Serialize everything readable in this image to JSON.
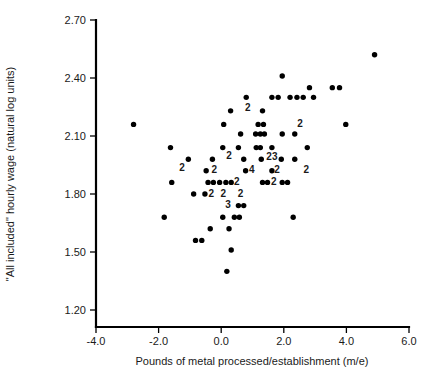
{
  "chart_data": {
    "type": "scatter",
    "title": "",
    "xlabel": "Pounds of metal processed/establishment (m/e)",
    "ylabel": "\"All included\" hourly wage (natural log units)",
    "xlim": [
      -4.0,
      6.0
    ],
    "ylim": [
      1.2,
      2.7
    ],
    "xticks": [
      "-4.0",
      "-2.0",
      "0.0",
      "2.0",
      "4.0",
      "6.0"
    ],
    "xtick_values": [
      -4.0,
      -2.0,
      0.0,
      2.0,
      4.0,
      6.0
    ],
    "yticks": [
      "2.70",
      "2.40",
      "2.10",
      "1.80",
      "1.50",
      "1.20"
    ],
    "ytick_values": [
      2.7,
      2.4,
      2.1,
      1.8,
      1.5,
      1.2
    ],
    "grid": false,
    "legend": false,
    "marker": "filled-circle",
    "marker_color": "#000000",
    "points": [
      [
        4.9,
        2.52
      ],
      [
        1.95,
        2.41
      ],
      [
        2.82,
        2.35
      ],
      [
        3.55,
        2.35
      ],
      [
        3.78,
        2.35
      ],
      [
        0.8,
        2.3
      ],
      [
        1.62,
        2.3
      ],
      [
        1.82,
        2.3
      ],
      [
        2.2,
        2.3
      ],
      [
        2.42,
        2.3
      ],
      [
        2.62,
        2.3
      ],
      [
        2.95,
        2.3
      ],
      [
        0.3,
        2.23
      ],
      [
        1.32,
        2.23
      ],
      [
        0.08,
        2.16
      ],
      [
        -2.8,
        2.16
      ],
      [
        1.18,
        2.16
      ],
      [
        1.35,
        2.16
      ],
      [
        3.98,
        2.16
      ],
      [
        0.62,
        2.11
      ],
      [
        1.1,
        2.11
      ],
      [
        1.25,
        2.11
      ],
      [
        1.38,
        2.11
      ],
      [
        1.95,
        2.11
      ],
      [
        2.35,
        2.11
      ],
      [
        -1.62,
        2.04
      ],
      [
        0.05,
        2.04
      ],
      [
        0.55,
        2.04
      ],
      [
        1.12,
        2.04
      ],
      [
        1.25,
        2.04
      ],
      [
        1.62,
        2.04
      ],
      [
        2.75,
        2.04
      ],
      [
        -1.05,
        1.98
      ],
      [
        -0.28,
        1.98
      ],
      [
        0.72,
        1.98
      ],
      [
        1.28,
        1.98
      ],
      [
        1.92,
        1.98
      ],
      [
        2.35,
        1.98
      ],
      [
        -0.48,
        1.92
      ],
      [
        0.78,
        1.92
      ],
      [
        1.62,
        1.92
      ],
      [
        -1.58,
        1.86
      ],
      [
        -0.42,
        1.86
      ],
      [
        -0.25,
        1.86
      ],
      [
        -0.05,
        1.86
      ],
      [
        0.15,
        1.86
      ],
      [
        0.32,
        1.86
      ],
      [
        1.32,
        1.86
      ],
      [
        1.48,
        1.86
      ],
      [
        1.95,
        1.86
      ],
      [
        2.12,
        1.86
      ],
      [
        -0.88,
        1.8
      ],
      [
        -0.52,
        1.8
      ],
      [
        0.55,
        1.74
      ],
      [
        0.72,
        1.74
      ],
      [
        -1.82,
        1.68
      ],
      [
        0.05,
        1.68
      ],
      [
        0.42,
        1.68
      ],
      [
        0.58,
        1.68
      ],
      [
        2.3,
        1.68
      ],
      [
        -0.35,
        1.62
      ],
      [
        0.25,
        1.62
      ],
      [
        -0.82,
        1.56
      ],
      [
        -0.62,
        1.56
      ],
      [
        0.32,
        1.51
      ],
      [
        0.18,
        1.4
      ]
    ],
    "count_labels": [
      {
        "x": 0.85,
        "y": 2.245,
        "text": "2"
      },
      {
        "x": 2.52,
        "y": 2.165,
        "text": "2"
      },
      {
        "x": 0.25,
        "y": 2.0,
        "text": "2"
      },
      {
        "x": 1.62,
        "y": 1.995,
        "text": "23"
      },
      {
        "x": -1.25,
        "y": 1.935,
        "text": "2"
      },
      {
        "x": -0.22,
        "y": 1.925,
        "text": "2"
      },
      {
        "x": 0.98,
        "y": 1.925,
        "text": "4"
      },
      {
        "x": 1.78,
        "y": 1.925,
        "text": "2"
      },
      {
        "x": 2.72,
        "y": 1.925,
        "text": "2"
      },
      {
        "x": 0.5,
        "y": 1.865,
        "text": "2"
      },
      {
        "x": 1.68,
        "y": 1.865,
        "text": "2"
      },
      {
        "x": -0.32,
        "y": 1.805,
        "text": "2"
      },
      {
        "x": 0.07,
        "y": 1.805,
        "text": "2"
      },
      {
        "x": 0.62,
        "y": 1.805,
        "text": "2"
      },
      {
        "x": 0.22,
        "y": 1.745,
        "text": "3"
      }
    ]
  },
  "axes": {
    "y_title": "\"All included\" hourly wage (natural log units)",
    "x_title": "Pounds of metal processed/establishment (m/e)",
    "y_tick_labels": [
      "2.70",
      "2.40",
      "2.10",
      "1.80",
      "1.50",
      "1.20"
    ],
    "x_tick_labels": [
      "-4.0",
      "-2.0",
      "0.0",
      "2.0",
      "4.0",
      "6.0"
    ]
  },
  "colors": {
    "marker": "#000000",
    "axis": "#000000",
    "text": "#1a1a1a",
    "background": "#ffffff"
  }
}
